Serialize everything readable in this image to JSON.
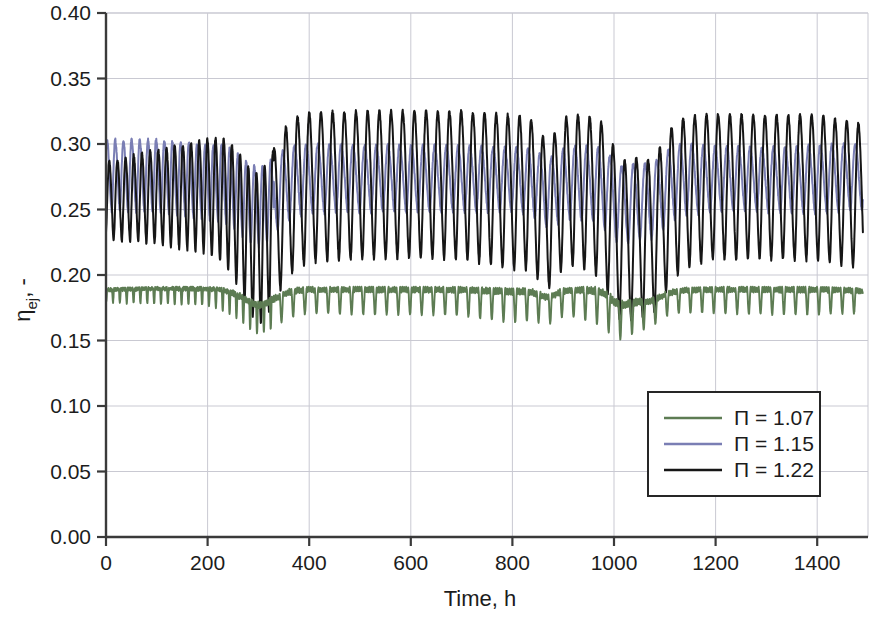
{
  "chart_data": {
    "type": "line",
    "title": "",
    "xlabel": "Time, h",
    "ylabel": "ηej, -",
    "ylabel_base": "η",
    "ylabel_sub": "ej",
    "ylabel_suffix": ", -",
    "xlim": [
      0,
      1500
    ],
    "ylim": [
      0.0,
      0.4
    ],
    "xticks": [
      0,
      200,
      400,
      600,
      800,
      1000,
      1200,
      1400
    ],
    "xtick_labels": [
      "0",
      "200",
      "400",
      "600",
      "800",
      "1000",
      "1200",
      "1400"
    ],
    "yticks": [
      0.0,
      0.05,
      0.1,
      0.15,
      0.2,
      0.25,
      0.3,
      0.35,
      0.4
    ],
    "ytick_labels": [
      "0.00",
      "0.05",
      "0.10",
      "0.15",
      "0.20",
      "0.25",
      "0.30",
      "0.35",
      "0.40"
    ],
    "grid": true,
    "grid_color": "#c9c9d2",
    "legend_position": "lower right",
    "series": [
      {
        "name": "Π = 1.07",
        "symbol": "Π",
        "value": "1.07",
        "color": "#5d7c53",
        "mean": 0.187,
        "peak": 0.192,
        "trough": 0.163,
        "description": "Lowest, nearly flat band around 0.185-0.19 with regular downward spikes to about 0.17; deeper dips to 0.155 near t=330, t=870 and t=1010"
      },
      {
        "name": "Π = 1.15",
        "symbol": "Π",
        "value": "1.15",
        "color": "#7a7eb4",
        "mean": 0.272,
        "peak": 0.307,
        "trough": 0.232,
        "description": "Mid band oscillating between about 0.24 and 0.305, slightly damped amplitude after t=350"
      },
      {
        "name": "Π = 1.22",
        "symbol": "Π",
        "value": "1.22",
        "color": "#161616",
        "mean": 0.268,
        "peak": 0.328,
        "trough": 0.195,
        "description": "Largest amplitude, oscillating between about 0.205 and 0.325; transient disturbance near t=270-330 dipping to 0.19 and again near t=1040-1090"
      }
    ],
    "sample_points": {
      "x": [
        0,
        100,
        200,
        300,
        400,
        500,
        600,
        700,
        800,
        900,
        1000,
        1100,
        1200,
        1300,
        1400,
        1490
      ],
      "p107_upper": [
        0.19,
        0.191,
        0.191,
        0.19,
        0.191,
        0.191,
        0.191,
        0.191,
        0.19,
        0.191,
        0.191,
        0.19,
        0.191,
        0.191,
        0.191,
        0.19
      ],
      "p107_lower": [
        0.179,
        0.178,
        0.177,
        0.165,
        0.171,
        0.17,
        0.17,
        0.169,
        0.164,
        0.17,
        0.16,
        0.172,
        0.171,
        0.17,
        0.17,
        0.171
      ],
      "p115_upper": [
        0.303,
        0.303,
        0.3,
        0.3,
        0.3,
        0.299,
        0.299,
        0.298,
        0.297,
        0.298,
        0.298,
        0.301,
        0.298,
        0.297,
        0.299,
        0.3
      ],
      "p115_lower": [
        0.249,
        0.248,
        0.243,
        0.24,
        0.247,
        0.248,
        0.248,
        0.248,
        0.248,
        0.244,
        0.238,
        0.244,
        0.248,
        0.248,
        0.247,
        0.25
      ],
      "p122_upper": [
        0.304,
        0.309,
        0.312,
        0.318,
        0.324,
        0.325,
        0.325,
        0.325,
        0.322,
        0.323,
        0.32,
        0.32,
        0.323,
        0.322,
        0.322,
        0.315
      ],
      "p122_lower": [
        0.209,
        0.21,
        0.208,
        0.196,
        0.21,
        0.212,
        0.213,
        0.212,
        0.204,
        0.21,
        0.196,
        0.201,
        0.212,
        0.212,
        0.211,
        0.205
      ]
    }
  },
  "legend": {
    "entries": [
      {
        "label": "Π = 1.07",
        "color": "#5d7c53"
      },
      {
        "label": "Π = 1.15",
        "color": "#7a7eb4"
      },
      {
        "label": "Π = 1.22",
        "color": "#161616"
      }
    ]
  }
}
